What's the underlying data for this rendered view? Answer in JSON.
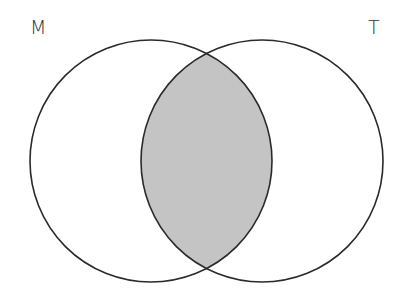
{
  "diagram": {
    "type": "venn",
    "sets": [
      {
        "label": "M",
        "cx": 151,
        "cy": 161,
        "r": 121
      },
      {
        "label": "T",
        "cx": 262,
        "cy": 161,
        "r": 121
      }
    ],
    "shaded_region": "M ∩ T",
    "colors": {
      "stroke": "#2a2a2a",
      "shade": "#c4c4c4",
      "background": "#ffffff"
    }
  }
}
